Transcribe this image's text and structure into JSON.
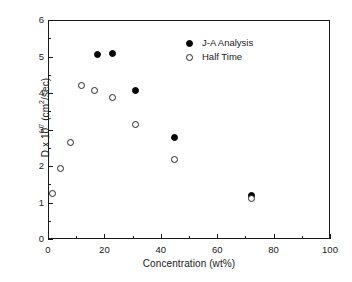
{
  "chart_data": {
    "type": "scatter",
    "title": "",
    "xlabel": "Concentration (wt%)",
    "ylabel_parts": {
      "pre": "D x 10",
      "exp": "7",
      "post": " (cm",
      "exp2": "2",
      "post2": "/sec)"
    },
    "ylabel": "D x 10^7 (cm2/sec)",
    "xlim": [
      0,
      100
    ],
    "ylim": [
      0,
      6
    ],
    "xticks": [
      0,
      20,
      40,
      60,
      80,
      100
    ],
    "yticks": [
      0,
      1,
      2,
      3,
      4,
      5,
      6
    ],
    "xticklabels": [
      "0",
      "20",
      "40",
      "60",
      "80",
      "100"
    ],
    "yticklabels": [
      "0",
      "1",
      "2",
      "3",
      "4",
      "5",
      "6"
    ],
    "x_minor_ticks": [
      10,
      30,
      50,
      70,
      90
    ],
    "y_minor_ticks": [
      0.5,
      1.5,
      2.5,
      3.5,
      4.5,
      5.5
    ],
    "grid": false,
    "legend_position": "upper right",
    "series": [
      {
        "name": "J-A Analysis",
        "marker": "filled-circle",
        "color": "#000000",
        "points": [
          {
            "x": 17.5,
            "y": 5.05
          },
          {
            "x": 23.0,
            "y": 5.07
          },
          {
            "x": 31.0,
            "y": 4.08
          },
          {
            "x": 45.0,
            "y": 2.78
          },
          {
            "x": 72.0,
            "y": 1.18
          }
        ]
      },
      {
        "name": "Half Time",
        "marker": "open-circle",
        "color": "#222222",
        "points": [
          {
            "x": 1.5,
            "y": 1.25
          },
          {
            "x": 4.5,
            "y": 1.93
          },
          {
            "x": 8.0,
            "y": 2.65
          },
          {
            "x": 12.0,
            "y": 4.2
          },
          {
            "x": 16.5,
            "y": 4.08
          },
          {
            "x": 23.0,
            "y": 3.88
          },
          {
            "x": 31.0,
            "y": 3.15
          },
          {
            "x": 45.0,
            "y": 2.17
          },
          {
            "x": 72.0,
            "y": 1.1
          }
        ]
      }
    ]
  },
  "legend": {
    "entries": [
      {
        "label": "J-A Analysis",
        "marker": "filled-circle"
      },
      {
        "label": "Half Time",
        "marker": "open-circle"
      }
    ]
  },
  "colors": {
    "axis": "#1a1a1a",
    "background": "#ffffff",
    "filled_marker": "#000000",
    "open_marker": "#222222"
  }
}
